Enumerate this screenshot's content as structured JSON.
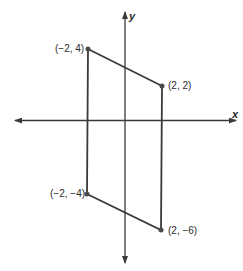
{
  "diagram": {
    "type": "coordinate-plane-parallelogram",
    "axes": {
      "x_label": "x",
      "y_label": "y"
    },
    "vertices": [
      {
        "label": "(−2, 4)",
        "x": -2,
        "y": 4
      },
      {
        "label": "(2, 2)",
        "x": 2,
        "y": 2
      },
      {
        "label": "(2, −6)",
        "x": 2,
        "y": -6
      },
      {
        "label": "(−2, −4)",
        "x": -2,
        "y": -4
      }
    ],
    "colors": {
      "axis": "#3a3a3a",
      "shape": "#3a3a3a",
      "point": "#4a4a4a"
    }
  }
}
